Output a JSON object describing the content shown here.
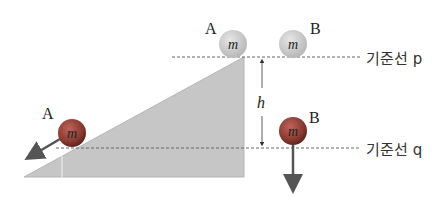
{
  "diagram": {
    "ground_slope": {
      "fill": "#c4c4c4",
      "edge": "#b0b0b0"
    },
    "reference_lines": {
      "p": {
        "label": "기준선 p"
      },
      "q": {
        "label": "기준선 q"
      }
    },
    "height_label": "h",
    "balls": {
      "a_top": {
        "name": "A",
        "mass": "m",
        "color": "#cfcfcf"
      },
      "b_top": {
        "name": "B",
        "mass": "m",
        "color": "#cfcfcf"
      },
      "a_bottom": {
        "name": "A",
        "mass": "m",
        "color": "#8a3b32"
      },
      "b_bottom": {
        "name": "B",
        "mass": "m",
        "color": "#8a3b32"
      }
    },
    "arrow_color": "#555555"
  }
}
